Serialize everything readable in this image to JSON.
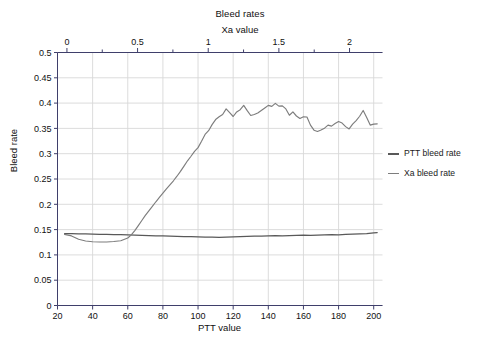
{
  "chart_data": {
    "type": "line",
    "title": "Bleed rates",
    "xlabel": "PTT value",
    "ylabel": "Bleed rate",
    "top_axis_label": "Xa value",
    "xlim": [
      20,
      205
    ],
    "ylim": [
      0,
      0.5
    ],
    "top_xlim": [
      -0.0667,
      2.2333
    ],
    "grid": true,
    "legend_position": "right",
    "y_ticks": [
      0,
      0.05,
      0.1,
      0.15,
      0.2,
      0.25,
      0.3,
      0.35,
      0.4,
      0.45,
      0.5
    ],
    "y_tick_labels": [
      "0",
      "0.05",
      "0.1",
      "0.15",
      "0.2",
      "0.25",
      "0.3",
      "0.35",
      "0.4",
      "0.45",
      "0.5"
    ],
    "x_ticks": [
      20,
      40,
      60,
      80,
      100,
      120,
      140,
      160,
      180,
      200
    ],
    "x_tick_labels": [
      "20",
      "40",
      "60",
      "80",
      "100",
      "120",
      "140",
      "160",
      "180",
      "200"
    ],
    "top_x_ticks": [
      0,
      0.5,
      1,
      1.5,
      2
    ],
    "top_x_tick_labels": [
      "0",
      "0.5",
      "1",
      "1.5",
      "2"
    ],
    "top_x_minor_ticks": [
      0.25,
      0.75,
      1.25,
      1.75,
      2.25
    ],
    "series": [
      {
        "name": "PTT bleed rate",
        "color": "#595959",
        "x": [
          24,
          28,
          32,
          36,
          40,
          44,
          48,
          52,
          56,
          60,
          64,
          68,
          72,
          76,
          80,
          84,
          88,
          92,
          96,
          100,
          104,
          108,
          112,
          116,
          120,
          124,
          128,
          132,
          136,
          140,
          144,
          148,
          152,
          156,
          160,
          164,
          168,
          172,
          176,
          180,
          184,
          188,
          192,
          196,
          200,
          202
        ],
        "values": [
          0.142,
          0.142,
          0.1415,
          0.1415,
          0.141,
          0.1405,
          0.1405,
          0.14,
          0.14,
          0.1395,
          0.139,
          0.1385,
          0.138,
          0.1375,
          0.1375,
          0.137,
          0.1365,
          0.136,
          0.136,
          0.1355,
          0.135,
          0.135,
          0.1345,
          0.135,
          0.1355,
          0.136,
          0.1365,
          0.137,
          0.137,
          0.1375,
          0.138,
          0.1375,
          0.138,
          0.1385,
          0.139,
          0.1385,
          0.139,
          0.1395,
          0.14,
          0.1395,
          0.1405,
          0.141,
          0.1415,
          0.142,
          0.1435,
          0.144
        ]
      },
      {
        "name": "Xa bleed rate",
        "color": "#7d7d7d",
        "x": [
          24,
          28,
          32,
          36,
          40,
          44,
          48,
          52,
          56,
          60,
          62,
          64,
          66,
          68,
          70,
          72,
          74,
          76,
          78,
          80,
          82,
          84,
          86,
          88,
          90,
          92,
          94,
          96,
          98,
          100,
          102,
          104,
          106,
          108,
          110,
          112,
          114,
          116,
          118,
          120,
          122,
          124,
          126,
          128,
          130,
          132,
          134,
          136,
          138,
          140,
          142,
          144,
          146,
          148,
          150,
          152,
          154,
          156,
          158,
          160,
          162,
          164,
          166,
          168,
          170,
          172,
          174,
          176,
          178,
          180,
          182,
          184,
          186,
          188,
          190,
          192,
          194,
          196,
          198,
          200,
          202
        ],
        "values": [
          0.1405,
          0.1375,
          0.131,
          0.1275,
          0.126,
          0.1255,
          0.1255,
          0.1265,
          0.128,
          0.1335,
          0.1395,
          0.148,
          0.158,
          0.168,
          0.178,
          0.187,
          0.196,
          0.205,
          0.2135,
          0.222,
          0.2305,
          0.2385,
          0.2465,
          0.2555,
          0.265,
          0.2755,
          0.286,
          0.295,
          0.3045,
          0.312,
          0.3245,
          0.338,
          0.3455,
          0.3575,
          0.3675,
          0.373,
          0.3775,
          0.3885,
          0.381,
          0.3735,
          0.3825,
          0.387,
          0.3955,
          0.385,
          0.3755,
          0.3775,
          0.3805,
          0.3855,
          0.3905,
          0.3955,
          0.3935,
          0.3995,
          0.394,
          0.3945,
          0.3885,
          0.376,
          0.3825,
          0.3745,
          0.3695,
          0.373,
          0.3725,
          0.3565,
          0.3465,
          0.344,
          0.347,
          0.3505,
          0.3565,
          0.3545,
          0.3595,
          0.3635,
          0.3605,
          0.3535,
          0.349,
          0.3585,
          0.3655,
          0.374,
          0.3855,
          0.3715,
          0.3565,
          0.3585,
          0.359
        ]
      }
    ]
  },
  "axis_frame_color": "#3f3f6b",
  "grid_color": "#d8d8d8"
}
